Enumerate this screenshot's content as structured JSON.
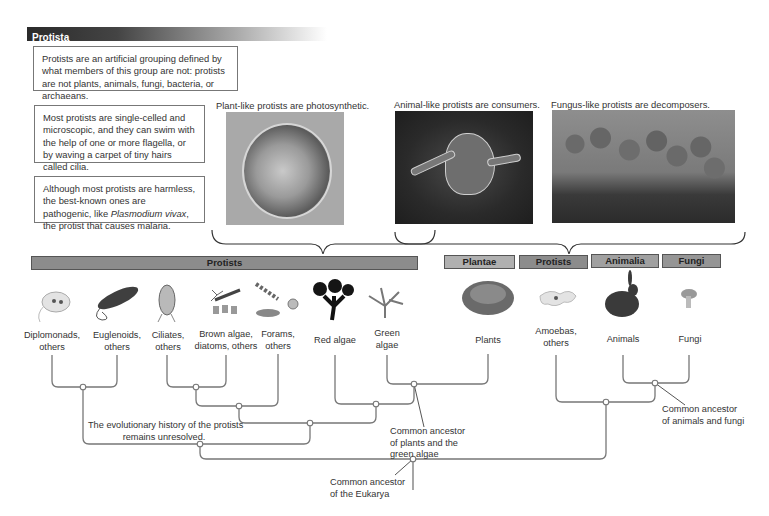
{
  "header": {
    "title": "Protista"
  },
  "notes": [
    {
      "text": "Protists are an artificial grouping defined by what members of this group are not: protists are not plants, animals, fungi, bacteria, or archaeans."
    },
    {
      "text": "Most protists are single-celled and microscopic, and they can swim with the help of one or more flagella, or by waving a carpet of tiny hairs called cilia."
    },
    {
      "text_before": "Although most protists are harmless, the best-known ones are pathogenic, like ",
      "italic": "Plasmodium vivax",
      "text_after": ", the protist that causes malaria."
    }
  ],
  "photos": [
    {
      "caption": "Plant-like protists are photosynthetic.",
      "subject": "photosynthetic-protist-micrograph"
    },
    {
      "caption": "Animal-like protists are consumers.",
      "subject": "amoeba-micrograph"
    },
    {
      "caption": "Fungus-like protists are decomposers.",
      "subject": "slime-mold-photo"
    }
  ],
  "category_bars": [
    {
      "label": "Protists",
      "color": "#8c8c8c"
    },
    {
      "label": "Plantae",
      "color": "#b0b0b0"
    },
    {
      "label": "Protists",
      "color": "#8c8c8c"
    },
    {
      "label": "Animalia",
      "color": "#a0a0a0"
    },
    {
      "label": "Fungi",
      "color": "#959595"
    }
  ],
  "leaves": [
    {
      "line1": "Diplomonads,",
      "line2": "others",
      "icon": "diplomonad-icon"
    },
    {
      "line1": "Euglenoids,",
      "line2": "others",
      "icon": "euglenoid-icon"
    },
    {
      "line1": "Ciliates,",
      "line2": "others",
      "icon": "ciliate-icon"
    },
    {
      "line1": "Brown algae,",
      "line2": "diatoms, others",
      "icon": "diatom-icon"
    },
    {
      "line1": "Forams,",
      "line2": "others",
      "icon": "foram-icon"
    },
    {
      "line1": "Red algae",
      "line2": "",
      "icon": "red-algae-icon"
    },
    {
      "line1": "Green",
      "line2": "algae",
      "icon": "green-algae-icon"
    },
    {
      "line1": "Plants",
      "line2": "",
      "icon": "plant-icon"
    },
    {
      "line1": "Amoebas,",
      "line2": "others",
      "icon": "amoeba-icon"
    },
    {
      "line1": "Animals",
      "line2": "",
      "icon": "rabbit-icon"
    },
    {
      "line1": "Fungi",
      "line2": "",
      "icon": "mushroom-icon"
    }
  ],
  "tree_labels": {
    "unresolved_1": "The evolutionary history of the protists",
    "unresolved_2": "remains unresolved.",
    "plants_ancestor_1": "Common ancestor",
    "plants_ancestor_2": "of plants and the",
    "plants_ancestor_3": "green algae",
    "eukarya_ancestor_1": "Common ancestor",
    "eukarya_ancestor_2": "of the Eukarya",
    "animals_fungi_ancestor_1": "Common ancestor",
    "animals_fungi_ancestor_2": "of animals and fungi"
  }
}
